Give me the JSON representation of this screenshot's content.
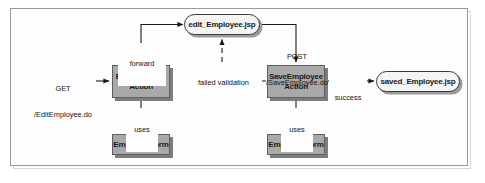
{
  "diagram": {
    "type": "flow-diagram",
    "background_color": "#fdfdfd",
    "frame_color": "#9a9a9a",
    "node_fill_color": "#a9a9a9",
    "jsp_fill_color": "#f4f4f4",
    "shadow_color": "#7d7d7d",
    "nodes": [
      {
        "id": "edit_jsp",
        "label": "edit_Employee.jsp",
        "shape": "rounded"
      },
      {
        "id": "edit_action",
        "label": "EditEmployee\nAction",
        "line1": "EditEmployee",
        "line2": "Action",
        "shape": "rect"
      },
      {
        "id": "save_action",
        "label": "SaveEmployee\nAction",
        "line1": "SaveEmployee",
        "line2": "Action",
        "shape": "rect"
      },
      {
        "id": "saved_jsp",
        "label": "saved_Employee.jsp",
        "shape": "rounded"
      },
      {
        "id": "edit_form",
        "label": "EmployeeForm",
        "shape": "rect"
      },
      {
        "id": "save_form",
        "label": "EmployeeForm",
        "shape": "rect"
      }
    ],
    "edges": [
      {
        "id": "get_request",
        "label_line1": "GET",
        "label_line2": "/EditEmployee.do",
        "from": "external",
        "to": "edit_action",
        "style": "solid"
      },
      {
        "id": "forward",
        "label_line1": "forward",
        "label_line2": "",
        "from": "edit_action",
        "to": "edit_jsp",
        "style": "solid"
      },
      {
        "id": "post_request",
        "label_line1": "POST",
        "label_line2": "/SaveEmployee.do",
        "from": "edit_jsp",
        "to": "save_action",
        "style": "solid"
      },
      {
        "id": "failed_validation",
        "label_line1": "failed validation",
        "label_line2": "",
        "from": "save_action",
        "to": "edit_jsp",
        "style": "dashed"
      },
      {
        "id": "success",
        "label_line1": "success",
        "label_line2": "",
        "from": "save_action",
        "to": "saved_jsp",
        "style": "solid"
      },
      {
        "id": "edit_uses",
        "label_line1": "uses",
        "label_line2": "",
        "from": "edit_action",
        "to": "edit_form",
        "style": "solid"
      },
      {
        "id": "save_uses",
        "label_line1": "uses",
        "label_line2": "",
        "from": "save_action",
        "to": "save_form",
        "style": "solid"
      }
    ]
  }
}
